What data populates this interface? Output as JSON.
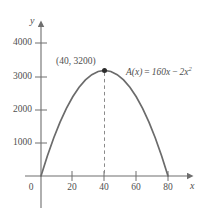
{
  "chart_data": {
    "type": "line",
    "title": "",
    "subtitle": "",
    "xlabel": "x",
    "ylabel": "y",
    "function_label": "A(x) = 160x − 2x²",
    "function_expression": {
      "name": "A(x)",
      "equals": "=",
      "term1": "160x",
      "operator": "−",
      "term2_base": "2x",
      "term2_exponent": "2"
    },
    "equation": "A(x) = 160x - 2x^2",
    "xlim": [
      -5,
      92
    ],
    "ylim": [
      -430,
      4700
    ],
    "xticks": [
      0,
      20,
      40,
      60,
      80
    ],
    "xtick_labels": [
      "0",
      "20",
      "40",
      "60",
      "80"
    ],
    "yticks": [
      1000,
      2000,
      3000,
      4000
    ],
    "ytick_labels": [
      "1000",
      "2000",
      "3000",
      "4000"
    ],
    "grid": false,
    "legend": "none",
    "x_roots": [
      0,
      80
    ],
    "vertex": {
      "x": 40,
      "y": 3200,
      "label": "(40, 3200)"
    },
    "annotations": [
      {
        "name": "vertex-label",
        "text": "(40, 3200)",
        "x": 40,
        "y": 3200
      },
      {
        "name": "function-label",
        "text": "A(x) = 160x − 2x²",
        "x": 56,
        "y": 3100
      }
    ],
    "markers": [
      {
        "name": "vertex-dot",
        "x": 40,
        "y": 3200,
        "style": "filled-circle"
      }
    ],
    "guides": [
      {
        "name": "vertex-dropline",
        "style": "dashed",
        "from": [
          40,
          0
        ],
        "to": [
          40,
          3200
        ]
      }
    ],
    "series": [
      {
        "name": "A(x) = 160x - 2x^2",
        "color": "#6b6b6b",
        "x": [
          0,
          4,
          8,
          12,
          16,
          20,
          24,
          28,
          32,
          36,
          40,
          44,
          48,
          52,
          56,
          60,
          64,
          68,
          72,
          76,
          80
        ],
        "values": [
          0,
          608,
          1152,
          1632,
          2048,
          2400,
          2688,
          2912,
          3072,
          3168,
          3200,
          3168,
          3072,
          2912,
          2688,
          2400,
          2048,
          1632,
          1152,
          608,
          0
        ]
      }
    ],
    "colors": {
      "curve": "#6b6b6b",
      "axis": "#6e6e6e",
      "text": "#4f4f4f",
      "marker": "#2b2b2b",
      "dashed_guide": "#8a8a8a",
      "background": "#ffffff"
    }
  },
  "axes": {
    "y_axis_name": "y",
    "x_axis_name": "x"
  }
}
